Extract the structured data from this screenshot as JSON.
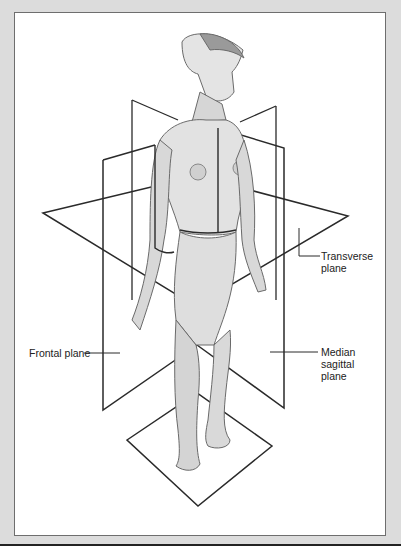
{
  "figure": {
    "labels": {
      "transverse": [
        "Transverse",
        "plane"
      ],
      "frontal": "Frontal plane",
      "median": [
        "Median",
        "sagittal",
        "plane"
      ]
    },
    "colors": {
      "background": "#dcdcdc",
      "panel": "#ffffff",
      "line": "#2a2a2a",
      "figure_shade": "#b5b5b5"
    }
  }
}
